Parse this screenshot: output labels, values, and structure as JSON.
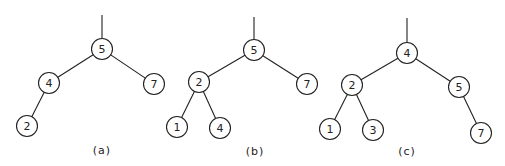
{
  "diagram": {
    "type": "binary-search-trees",
    "node_radius": 10.5,
    "stroke_color": "#222222",
    "background": "#ffffff",
    "trees": [
      {
        "id": "a",
        "label": "(a)",
        "label_pos": [
          102,
          154
        ],
        "root_stub": [
          102,
          15
        ],
        "nodes": [
          {
            "id": "a5",
            "value": "5",
            "x": 102,
            "y": 49
          },
          {
            "id": "a4",
            "value": "4",
            "x": 49,
            "y": 83
          },
          {
            "id": "a7",
            "value": "7",
            "x": 154,
            "y": 84
          },
          {
            "id": "a2",
            "value": "2",
            "x": 27,
            "y": 126
          }
        ],
        "edges": [
          [
            "a5",
            "a4"
          ],
          [
            "a5",
            "a7"
          ],
          [
            "a4",
            "a2"
          ]
        ]
      },
      {
        "id": "b",
        "label": "(b)",
        "label_pos": [
          255,
          155
        ],
        "root_stub": [
          254,
          17
        ],
        "nodes": [
          {
            "id": "b5",
            "value": "5",
            "x": 254,
            "y": 50
          },
          {
            "id": "b2",
            "value": "2",
            "x": 199,
            "y": 82
          },
          {
            "id": "b7",
            "value": "7",
            "x": 307,
            "y": 84
          },
          {
            "id": "b1",
            "value": "1",
            "x": 177,
            "y": 127
          },
          {
            "id": "b4",
            "value": "4",
            "x": 220,
            "y": 128
          }
        ],
        "edges": [
          [
            "b5",
            "b2"
          ],
          [
            "b5",
            "b7"
          ],
          [
            "b2",
            "b1"
          ],
          [
            "b2",
            "b4"
          ]
        ]
      },
      {
        "id": "c",
        "label": "(c)",
        "label_pos": [
          407,
          155
        ],
        "root_stub": [
          407,
          18
        ],
        "nodes": [
          {
            "id": "c4",
            "value": "4",
            "x": 407,
            "y": 53
          },
          {
            "id": "c2",
            "value": "2",
            "x": 352,
            "y": 85
          },
          {
            "id": "c5",
            "value": "5",
            "x": 459,
            "y": 87
          },
          {
            "id": "c1",
            "value": "1",
            "x": 330,
            "y": 129
          },
          {
            "id": "c3",
            "value": "3",
            "x": 373,
            "y": 130
          },
          {
            "id": "c7",
            "value": "7",
            "x": 481,
            "y": 133
          }
        ],
        "edges": [
          [
            "c4",
            "c2"
          ],
          [
            "c4",
            "c5"
          ],
          [
            "c2",
            "c1"
          ],
          [
            "c2",
            "c3"
          ],
          [
            "c5",
            "c7"
          ]
        ]
      }
    ]
  }
}
